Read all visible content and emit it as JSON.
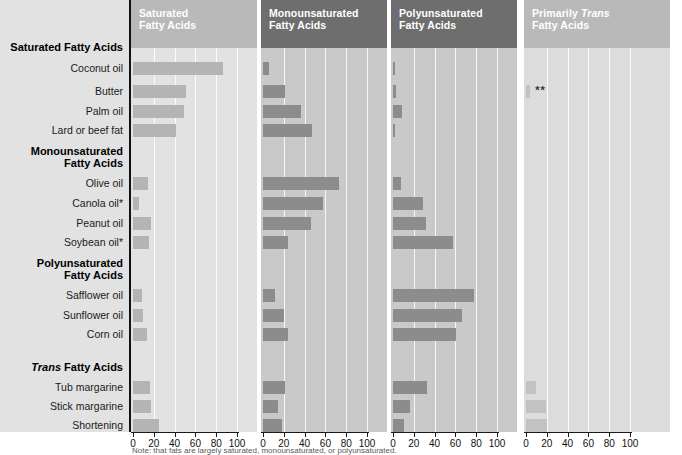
{
  "figure": {
    "footnote": "Note: that fats are largely saturated, monounsaturated, or polyunsaturated."
  },
  "row_labels": {
    "groups": [
      {
        "label": "Saturated Fatty Acids",
        "italic_word": ""
      },
      {
        "label": "Monounsaturated Fatty Acids",
        "line1": "Monounsaturated",
        "line2": "Fatty Acids"
      },
      {
        "label": "Polyunsaturated Fatty Acids",
        "line1": "Polyunsaturated",
        "line2": "Fatty Acids"
      },
      {
        "label": "Trans Fatty Acids",
        "italic_word": "Trans",
        "rest": " Fatty Acids"
      }
    ],
    "items": [
      "Coconut oil",
      "Butter",
      "Palm oil",
      "Lard or beef fat",
      "Olive oil",
      "Canola oil*",
      "Peanut oil",
      "Soybean oil*",
      "Safflower oil",
      "Sunflower oil",
      "Corn oil",
      "Tub margarine",
      "Stick margarine",
      "Shortening"
    ]
  },
  "panels": [
    {
      "id": "saturated",
      "title_line1": "Saturated",
      "title_line2": "Fatty Acids",
      "header_color": "#b9b9b9",
      "plot_bg": "#e2e2e2",
      "bar_color": "#b4b4b4"
    },
    {
      "id": "monounsaturated",
      "title_line1": "Monounsaturated",
      "title_line2": "Fatty Acids",
      "header_color": "#6e6e6e",
      "plot_bg": "#c9c9c9",
      "bar_color": "#8c8c8c"
    },
    {
      "id": "polyunsaturated",
      "title_line1": "Polyunsaturated",
      "title_line2": "Fatty Acids",
      "header_color": "#6e6e6e",
      "plot_bg": "#c9c9c9",
      "bar_color": "#8c8c8c"
    },
    {
      "id": "trans",
      "title_line1": "Primarily ",
      "title_italic": "Trans",
      "title_line2": "Fatty Acids",
      "header_color": "#b9b9b9",
      "plot_bg": "#dcdcdc",
      "bar_color": "#c2c2c2"
    }
  ],
  "axis": {
    "ticks": [
      0,
      20,
      40,
      60,
      80,
      100
    ],
    "min": 0,
    "max": 100,
    "tick_labels": [
      "0",
      "20",
      "40",
      "60",
      "80",
      "100"
    ]
  },
  "chart_data": {
    "type": "bar",
    "xlabel": "Percent of total fatty acids",
    "ylabel": "",
    "xlim": [
      0,
      100
    ],
    "grid": true,
    "legend": "none",
    "orientation": "horizontal",
    "panel_layout": "small-multiples",
    "categories": [
      "Coconut oil",
      "Butter",
      "Palm oil",
      "Lard or beef fat",
      "Olive oil",
      "Canola oil*",
      "Peanut oil",
      "Soybean oil*",
      "Safflower oil",
      "Sunflower oil",
      "Corn oil",
      "Tub margarine",
      "Stick margarine",
      "Shortening"
    ],
    "category_groups": [
      {
        "name": "Saturated Fatty Acids",
        "members": [
          "Coconut oil",
          "Butter",
          "Palm oil",
          "Lard or beef fat"
        ]
      },
      {
        "name": "Monounsaturated Fatty Acids",
        "members": [
          "Olive oil",
          "Canola oil*",
          "Peanut oil",
          "Soybean oil*"
        ]
      },
      {
        "name": "Polyunsaturated Fatty Acids",
        "members": [
          "Safflower oil",
          "Sunflower oil",
          "Corn oil"
        ]
      },
      {
        "name": "Trans Fatty Acids",
        "members": [
          "Tub margarine",
          "Stick margarine",
          "Shortening"
        ]
      }
    ],
    "series": [
      {
        "name": "Saturated Fatty Acids",
        "values": [
          87,
          51,
          49,
          41,
          14,
          6,
          17,
          15,
          9,
          10,
          13,
          16,
          17,
          25
        ]
      },
      {
        "name": "Monounsaturated Fatty Acids",
        "values": [
          6,
          21,
          37,
          47,
          73,
          58,
          46,
          24,
          12,
          20,
          24,
          21,
          14,
          18
        ]
      },
      {
        "name": "Polyunsaturated Fatty Acids",
        "values": [
          2,
          3,
          9,
          2,
          8,
          29,
          32,
          58,
          78,
          66,
          61,
          33,
          16,
          11
        ]
      },
      {
        "name": "Primarily Trans Fatty Acids",
        "values": [
          0,
          4,
          0,
          0,
          0,
          0,
          0,
          0,
          0,
          0,
          0,
          10,
          19,
          20
        ]
      }
    ],
    "annotations": [
      {
        "panel": "trans",
        "category": "Butter",
        "text": "**"
      }
    ]
  }
}
